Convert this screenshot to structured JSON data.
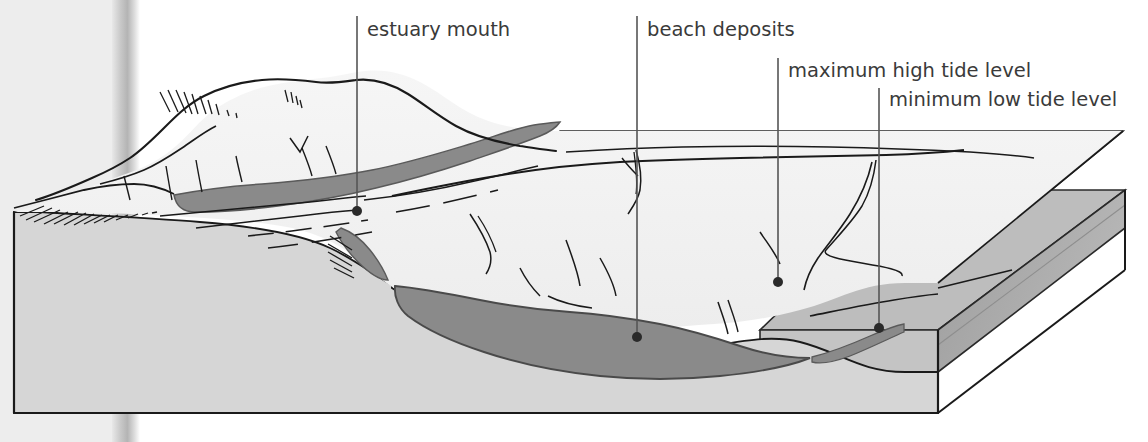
{
  "figure": {
    "kind": "geological-block-diagram",
    "background_color": "#ffffff",
    "ink_color": "#1a1a1a",
    "label_color": "#3a3a3a"
  },
  "palette": {
    "land_top": "#f2f2f2",
    "land_face": "#d6d6d6",
    "land_face_dark": "#c9c9c9",
    "deposit_dark": "#8a8a8a",
    "deposit_dark_edge": "#6f6f6f",
    "water_upper": "#ececec",
    "water_slab_top": "#bdbdbd",
    "water_slab_front": "#c4c4c4",
    "water_slab_side": "#a9a9a9",
    "gutter_shadow": "#b9b9b9",
    "page_tint": "#ededed"
  },
  "labels": [
    {
      "id": "estuary-mouth",
      "text": "estuary mouth",
      "text_x": 367,
      "text_y": 36,
      "anchor": "start",
      "leader_x": 357,
      "leader_top": 16,
      "leader_bottom": 211,
      "dot_x": 357,
      "dot_y": 211,
      "dot_r": 5
    },
    {
      "id": "beach-deposits",
      "text": "beach deposits",
      "text_x": 647,
      "text_y": 36,
      "anchor": "start",
      "leader_x": 637,
      "leader_top": 16,
      "leader_bottom": 337,
      "dot_x": 637,
      "dot_y": 337,
      "dot_r": 5
    },
    {
      "id": "maximum-high-tide-level",
      "text": "maximum high tide level",
      "text_x": 788,
      "text_y": 77,
      "anchor": "start",
      "leader_x": 778,
      "leader_top": 58,
      "leader_bottom": 282,
      "dot_x": 778,
      "dot_y": 282,
      "dot_r": 5
    },
    {
      "id": "minimum-low-tide-level",
      "text": "minimum low tide level",
      "text_x": 889,
      "text_y": 106,
      "anchor": "start",
      "leader_x": 879,
      "leader_top": 88,
      "leader_bottom": 328,
      "dot_x": 879,
      "dot_y": 328,
      "dot_r": 5
    }
  ],
  "geometry": {
    "block": {
      "left_edge_x": 14,
      "top_left_y": 212,
      "bottom_y": 413,
      "front_right_x": 938,
      "back_right_x": 1125
    },
    "water_planes": {
      "upper_back_edge_y": 131,
      "lower_back_edge_y": 190,
      "right_corner_upper": [
        1123,
        133
      ],
      "right_corner_lower": [
        1125,
        190
      ]
    }
  }
}
